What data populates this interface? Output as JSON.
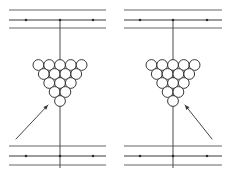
{
  "figure": {
    "canvas": {
      "width": 231,
      "height": 176,
      "background": "#ffffff"
    },
    "ink_color": "#2f2f2f",
    "line_color": "#3b3b3b",
    "dot_color": "#2b2b2b",
    "panels": [
      {
        "id": "panel-left",
        "label": "left-panel",
        "origin_x": 0,
        "rail_x_start": 9,
        "rail_x_end": 106,
        "axis_x": 60,
        "axis_y_top": 20,
        "axis_y_bottom": 168,
        "rails_top_y": [
          10,
          20,
          28
        ],
        "rails_bottom_y": [
          146,
          156,
          165
        ],
        "dots_top": [
          {
            "x": 26,
            "y": 20
          },
          {
            "x": 60,
            "y": 20
          },
          {
            "x": 93,
            "y": 20
          }
        ],
        "dots_bottom": [
          {
            "x": 26,
            "y": 156
          },
          {
            "x": 60,
            "y": 156
          },
          {
            "x": 93,
            "y": 156
          }
        ],
        "rack": {
          "apex_x": 60,
          "apex_y": 101,
          "row_counts": [
            5,
            4,
            3,
            2,
            1
          ],
          "top_row_y": 65,
          "ball_radius": 5.4,
          "x_spacing": 10.8,
          "y_spacing": 9.0,
          "ball_count": 15
        },
        "arrow": {
          "label": "cue-direction-arrow",
          "from_x": 16,
          "from_y": 139,
          "to_x": 48,
          "to_y": 105,
          "head_size": 4.6
        }
      },
      {
        "id": "panel-right",
        "label": "right-panel",
        "origin_x": 115,
        "rail_x_start": 124,
        "rail_x_end": 222,
        "axis_x": 173,
        "axis_y_top": 20,
        "axis_y_bottom": 168,
        "rails_top_y": [
          10,
          20,
          28
        ],
        "rails_bottom_y": [
          146,
          156,
          165
        ],
        "dots_top": [
          {
            "x": 140,
            "y": 20
          },
          {
            "x": 173,
            "y": 20
          },
          {
            "x": 207,
            "y": 20
          }
        ],
        "dots_bottom": [
          {
            "x": 140,
            "y": 156
          },
          {
            "x": 173,
            "y": 156
          },
          {
            "x": 207,
            "y": 156
          }
        ],
        "rack": {
          "apex_x": 173,
          "apex_y": 101,
          "row_counts": [
            5,
            4,
            3,
            2,
            1
          ],
          "top_row_y": 65,
          "ball_radius": 5.4,
          "x_spacing": 10.8,
          "y_spacing": 9.0,
          "ball_count": 15
        },
        "arrow": {
          "label": "cue-direction-arrow",
          "from_x": 212,
          "from_y": 139,
          "to_x": 185,
          "to_y": 105,
          "head_size": 4.6
        }
      }
    ]
  }
}
